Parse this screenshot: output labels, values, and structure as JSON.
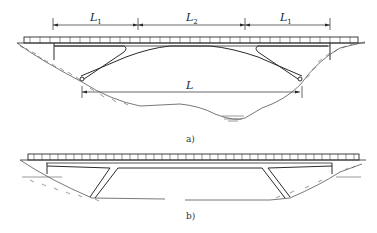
{
  "figure_a": {
    "caption": "a)",
    "dimensions": [
      {
        "label": "L",
        "subscript": "1"
      },
      {
        "label": "L",
        "subscript": "2"
      },
      {
        "label": "L",
        "subscript": "1"
      }
    ],
    "span_label": "L"
  },
  "figure_b": {
    "caption": "b)"
  },
  "colors": {
    "line": "#2a2a2a",
    "ground": "#555555"
  }
}
